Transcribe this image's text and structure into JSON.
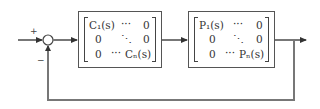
{
  "diagram": {
    "type": "block-diagram",
    "summing_junction": {
      "plus_sign": "+",
      "minus_sign": "−"
    },
    "controller": {
      "rows": [
        [
          "C₁(s)",
          "···",
          "0"
        ],
        [
          "0",
          "⋱",
          "0"
        ],
        [
          "0",
          "···",
          "Cₙ(s)"
        ]
      ]
    },
    "plant": {
      "rows": [
        [
          "P₁(s)",
          "···",
          "0"
        ],
        [
          "0",
          "⋱",
          "0"
        ],
        [
          "0",
          "···",
          "Pₙ(s)"
        ]
      ]
    },
    "colors": {
      "line": "#666666",
      "box": "#555555",
      "text": "#333333"
    }
  }
}
